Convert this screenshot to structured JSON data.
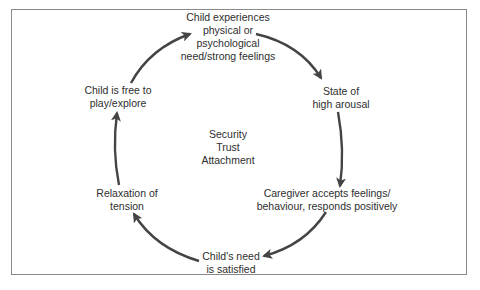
{
  "diagram": {
    "type": "cycle",
    "colors": {
      "arrow": "#444444",
      "text": "#2e2e2e",
      "frame": "#8a8a8a",
      "background": "#ffffff"
    },
    "center_label": {
      "lines": [
        "Security",
        "Trust",
        "Attachment"
      ]
    },
    "nodes": [
      {
        "id": "need",
        "lines": [
          "Child experiences",
          "physical or",
          "psychological",
          "need/strong feelings"
        ]
      },
      {
        "id": "arousal",
        "lines": [
          "State of",
          "high arousal"
        ]
      },
      {
        "id": "caregiver",
        "lines": [
          "Caregiver accepts feelings/",
          "behaviour, responds positively"
        ]
      },
      {
        "id": "satisfied",
        "lines": [
          "Child's need",
          "is satisfied"
        ]
      },
      {
        "id": "relaxation",
        "lines": [
          "Relaxation of",
          "tension"
        ]
      },
      {
        "id": "free",
        "lines": [
          "Child is free to",
          "play/explore"
        ]
      }
    ],
    "edges": [
      {
        "from": "need",
        "to": "arousal"
      },
      {
        "from": "arousal",
        "to": "caregiver"
      },
      {
        "from": "caregiver",
        "to": "satisfied"
      },
      {
        "from": "satisfied",
        "to": "relaxation"
      },
      {
        "from": "relaxation",
        "to": "free"
      },
      {
        "from": "free",
        "to": "need"
      }
    ]
  }
}
